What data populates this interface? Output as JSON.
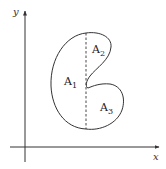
{
  "figure": {
    "axes": {
      "x_label": "x",
      "y_label": "y"
    },
    "regions": [
      {
        "name": "A",
        "subscript": "1",
        "description": "left part of region, left of dashed line"
      },
      {
        "name": "A",
        "subscript": "2",
        "description": "upper-right lobe, right of dashed line"
      },
      {
        "name": "A",
        "subscript": "3",
        "description": "lower-right lobe, right of dashed line"
      }
    ],
    "divider": "dashed vertical line",
    "colors": {
      "stroke": "#333333",
      "axis": "#333333",
      "background": "#ffffff"
    }
  }
}
